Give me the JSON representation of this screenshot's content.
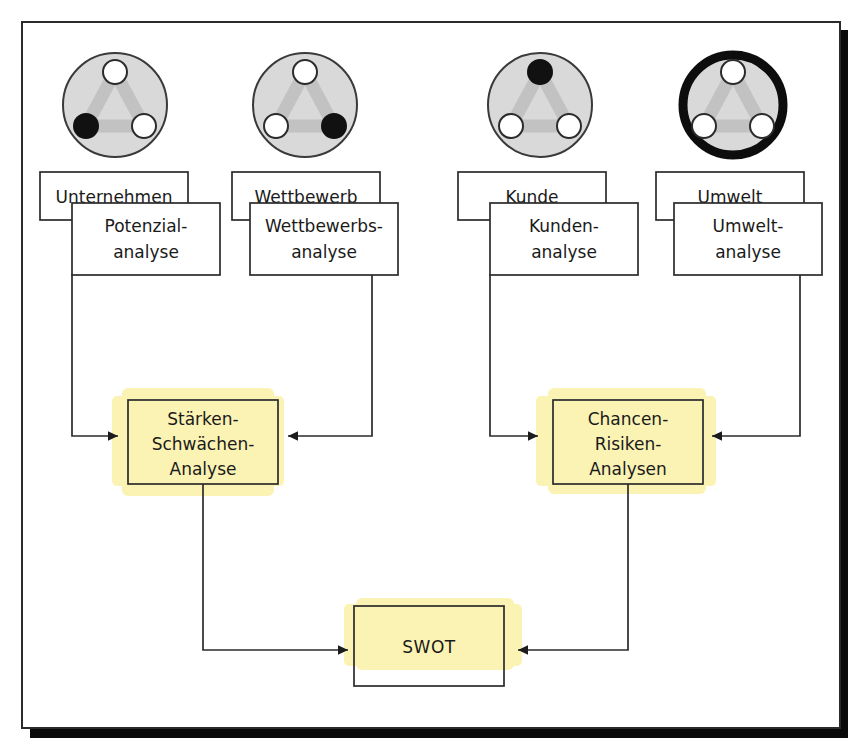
{
  "diagram": {
    "language": "de",
    "frame": {
      "border_color": "#2b2b2b",
      "shadow_color": "#0a0a0a",
      "page_color": "#ffffff"
    },
    "colors": {
      "highlight_yellow": "#fbf3b4",
      "circle_fill": "#d9d9d9",
      "circle_stroke": "#3a3a3a",
      "triangle_gray": "#c2c2c2",
      "node_filled": "#111111",
      "node_empty": "#ffffff",
      "line": "#2b2b2b",
      "text": "#1a1a1a"
    },
    "icons": [
      {
        "name": "perspective-icon-unternehmen",
        "highlighted_node": "bottom-left",
        "ring": "thin",
        "nodes": [
          "top",
          "bottom-left",
          "bottom-right"
        ]
      },
      {
        "name": "perspective-icon-wettbewerb",
        "highlighted_node": "bottom-right",
        "ring": "thin",
        "nodes": [
          "top",
          "bottom-left",
          "bottom-right"
        ]
      },
      {
        "name": "perspective-icon-kunde",
        "highlighted_node": "top",
        "ring": "thin",
        "nodes": [
          "top",
          "bottom-left",
          "bottom-right"
        ]
      },
      {
        "name": "perspective-icon-umwelt",
        "highlighted_node": "none",
        "ring": "thick",
        "nodes": [
          "top",
          "bottom-left",
          "bottom-right"
        ]
      }
    ],
    "columns": [
      {
        "key": "unternehmen",
        "perspective_label": "Unternehmen",
        "analysis_label_line1": "Potenzial-",
        "analysis_label_line2": "analyse"
      },
      {
        "key": "wettbewerb",
        "perspective_label": "Wettbewerb",
        "analysis_label_line1": "Wettbewerbs-",
        "analysis_label_line2": "analyse"
      },
      {
        "key": "kunde",
        "perspective_label": "Kunde",
        "analysis_label_line1": "Kunden-",
        "analysis_label_line2": "analyse"
      },
      {
        "key": "umwelt",
        "perspective_label": "Umwelt",
        "analysis_label_line1": "Umwelt-",
        "analysis_label_line2": "analyse"
      }
    ],
    "mid_nodes": [
      {
        "key": "staerken-schwaechen",
        "line1": "Stärken-",
        "line2": "Schwächen-",
        "line3": "Analyse",
        "highlighted": true,
        "inputs": [
          "unternehmen",
          "wettbewerb"
        ]
      },
      {
        "key": "chancen-risiken",
        "line1": "Chancen-",
        "line2": "Risiken-",
        "line3": "Analysen",
        "highlighted": true,
        "inputs": [
          "kunde",
          "umwelt"
        ]
      }
    ],
    "result_node": {
      "key": "swot",
      "label": "SWOT",
      "highlighted": true,
      "inputs": [
        "staerken-schwaechen",
        "chancen-risiken"
      ]
    }
  }
}
